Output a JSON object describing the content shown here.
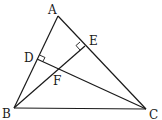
{
  "diagram": {
    "type": "triangle-altitudes",
    "points": {
      "A": {
        "label": "A",
        "x": 58,
        "y": 16
      },
      "B": {
        "label": "B",
        "x": 14,
        "y": 108
      },
      "C": {
        "label": "C",
        "x": 146,
        "y": 109
      },
      "D": {
        "label": "D",
        "x": 37,
        "y": 59
      },
      "E": {
        "label": "E",
        "x": 85,
        "y": 46
      },
      "F": {
        "label": "F",
        "x": 57,
        "y": 70
      }
    },
    "segments": [
      "AB",
      "BC",
      "CA",
      "BE",
      "CD"
    ],
    "right_angles": [
      "D",
      "E"
    ]
  }
}
